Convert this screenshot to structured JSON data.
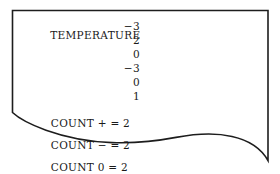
{
  "figure": {
    "kind": "torn-paper-printout",
    "background_color": "#ffffff",
    "ink_color": "#1a1a1a",
    "border_color": "#1d1d1d"
  },
  "printout": {
    "label": "TEMPERATURE",
    "readings": [
      "−3",
      "2",
      "0",
      "−3",
      "0",
      "1"
    ],
    "totals": [
      {
        "name": "COUNT + = 2",
        "label": "COUNT",
        "sign": "+",
        "equals": "=",
        "value": "2"
      },
      {
        "name": "COUNT − = 2",
        "label": "COUNT",
        "sign": "−",
        "equals": "=",
        "value": "2"
      },
      {
        "name": "COUNT 0 = 2",
        "label": "COUNT",
        "sign": "0",
        "equals": "=",
        "value": "2"
      }
    ],
    "totals_line": "COUNT + = 2  COUNT − = 2  COUNT 0 = 2"
  }
}
